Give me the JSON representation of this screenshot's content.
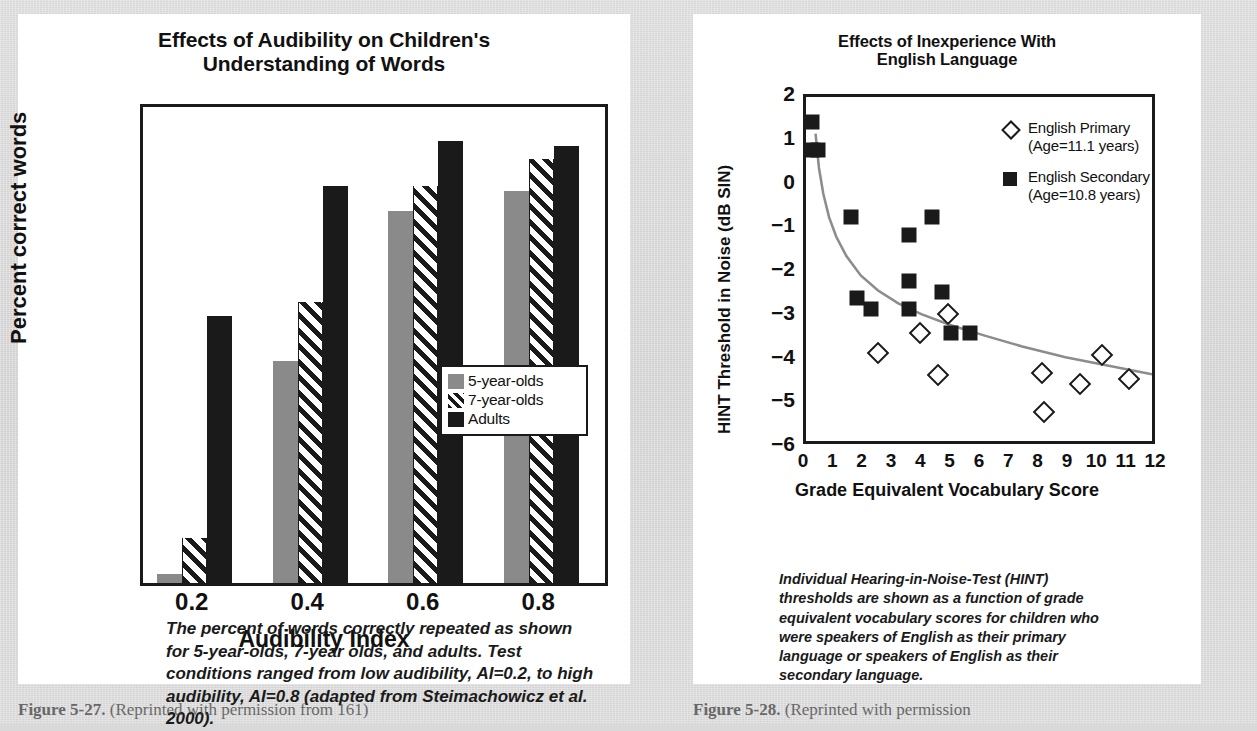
{
  "page": {
    "background_color": "#d9d9d9"
  },
  "left_panel": {
    "title_line1": "Effects of Audibility on Children's",
    "title_line2": "Understanding of Words",
    "ylabel": "Percent correct words",
    "xlabel": "Audibility Index",
    "legend": [
      {
        "label": "5-year-olds",
        "swatch": "gray-square-icon"
      },
      {
        "label": "7-year-olds",
        "swatch": "hatched-square-icon"
      },
      {
        "label": "Adults",
        "swatch": "black-square-icon"
      }
    ],
    "caption": "The percent of words correctly repeated as shown for 5-year-olds, 7-year olds, and adults. Test conditions ranged from low audibility, AI=0.2, to high audibility, AI=0.8 (adapted from Steimachowicz et al. 2000)."
  },
  "right_panel": {
    "title_line1": "Effects of Inexperience With",
    "title_line2": "English Language",
    "ylabel": "HINT Threshold in Noise (dB SIN)",
    "xlabel": "Grade Equivalent Vocabulary Score",
    "legend": [
      {
        "label_line1": "English Primary",
        "label_line2": "(Age=11.1 years)",
        "marker": "open-diamond-icon"
      },
      {
        "label_line1": "English Secondary",
        "label_line2": "(Age=10.8 years)",
        "marker": "filled-square-icon"
      }
    ],
    "caption": "Individual Hearing-in-Noise-Test (HINT) thresholds are shown as a function of grade equivalent vocabulary scores for children who were speakers of English as their primary language or speakers of English as their secondary language."
  },
  "figure_captions": {
    "left_number": "Figure 5-27.",
    "left_text": "(Reprinted with permission from 161)",
    "right_number": "Figure 5-28.",
    "right_text": "(Reprinted with permission"
  },
  "chart_data": [
    {
      "id": "bar-chart",
      "type": "bar",
      "title": "Effects of Audibility on Children's Understanding of Words",
      "xlabel": "Audibility Index",
      "ylabel": "Percent correct words",
      "categories": [
        "0.2",
        "0.4",
        "0.6",
        "0.8"
      ],
      "yticks": [
        0,
        10,
        20,
        30,
        40,
        50,
        60,
        70,
        80,
        90,
        100
      ],
      "ylim": [
        0,
        105
      ],
      "grid": false,
      "legend_position": "inside-lower-right",
      "series": [
        {
          "name": "5-year-olds",
          "color": "#8a8a8a",
          "fill": "solid-gray",
          "values": [
            2,
            49,
            82,
            86.5
          ]
        },
        {
          "name": "7-year-olds",
          "color": "#1a1a1a",
          "fill": "diagonal-hatch",
          "values": [
            10,
            62,
            87.5,
            93.5
          ]
        },
        {
          "name": "Adults",
          "color": "#1a1a1a",
          "fill": "solid-black",
          "values": [
            59,
            87.5,
            97.5,
            96.5
          ]
        }
      ]
    },
    {
      "id": "scatter-chart",
      "type": "scatter",
      "title": "Effects of Inexperience With English Language",
      "xlabel": "Grade Equivalent Vocabulary Score",
      "ylabel": "HINT Threshold in Noise (dB SIN)",
      "xticks": [
        0,
        1,
        2,
        3,
        4,
        5,
        6,
        7,
        8,
        9,
        10,
        11,
        12
      ],
      "yticks": [
        -6,
        -5,
        -4,
        -3,
        -2,
        -1,
        0,
        1,
        2
      ],
      "xlim": [
        0,
        12
      ],
      "ylim": [
        -6,
        2
      ],
      "grid": false,
      "legend_position": "inside-upper-right",
      "series": [
        {
          "name": "English Primary (Age=11.1 years)",
          "marker": "open-diamond",
          "color": "#ffffff",
          "edge_color": "#1a1a1a",
          "points": [
            [
              2.45,
              -3.85
            ],
            [
              3.9,
              -3.4
            ],
            [
              4.5,
              -4.35
            ],
            [
              4.85,
              -2.95
            ],
            [
              8.05,
              -4.3
            ],
            [
              8.1,
              -5.2
            ],
            [
              9.35,
              -4.55
            ],
            [
              10.1,
              -3.9
            ],
            [
              11.0,
              -4.45
            ]
          ]
        },
        {
          "name": "English Secondary (Age=10.8 years)",
          "marker": "filled-square",
          "color": "#1a1a1a",
          "points": [
            [
              0.22,
              1.42
            ],
            [
              0.22,
              0.78
            ],
            [
              0.42,
              0.78
            ],
            [
              1.55,
              -0.75
            ],
            [
              1.75,
              -2.6
            ],
            [
              2.2,
              -2.85
            ],
            [
              3.5,
              -1.15
            ],
            [
              3.5,
              -2.2
            ],
            [
              3.5,
              -2.85
            ],
            [
              4.3,
              -0.75
            ],
            [
              4.65,
              -2.45
            ],
            [
              4.95,
              -3.4
            ],
            [
              5.6,
              -3.4
            ]
          ]
        }
      ],
      "trend_line": {
        "description": "decaying logarithmic fit curve",
        "color": "#8c8c8c",
        "points": [
          [
            0.33,
            1.15
          ],
          [
            0.45,
            0.35
          ],
          [
            0.6,
            -0.25
          ],
          [
            0.8,
            -0.8
          ],
          [
            1.05,
            -1.25
          ],
          [
            1.4,
            -1.7
          ],
          [
            1.9,
            -2.15
          ],
          [
            2.5,
            -2.5
          ],
          [
            3.2,
            -2.8
          ],
          [
            4.0,
            -3.05
          ],
          [
            5.0,
            -3.3
          ],
          [
            6.2,
            -3.55
          ],
          [
            7.5,
            -3.8
          ],
          [
            9.0,
            -4.05
          ],
          [
            10.5,
            -4.25
          ],
          [
            12.0,
            -4.45
          ]
        ]
      }
    }
  ]
}
